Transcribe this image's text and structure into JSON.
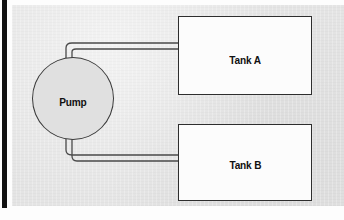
{
  "diagram": {
    "background_color": "#e4e4e4",
    "line_color": "#3a3a3a",
    "components": {
      "pump": {
        "label": "Pump",
        "shape": "circle",
        "fill_color": "#e0e0e0"
      },
      "tank_a": {
        "label": "Tank A",
        "shape": "rectangle",
        "fill_color": "#fcfcfc"
      },
      "tank_b": {
        "label": "Tank B",
        "shape": "rectangle",
        "fill_color": "#fcfcfc"
      }
    },
    "connections": [
      {
        "name": "pump-to-tank-a",
        "from": "pump",
        "to": "tank_a",
        "style": "double-line-pipe"
      },
      {
        "name": "pump-to-tank-b",
        "from": "pump",
        "to": "tank_b",
        "style": "double-line-pipe"
      }
    ],
    "margin_bar_color": "#111111"
  }
}
